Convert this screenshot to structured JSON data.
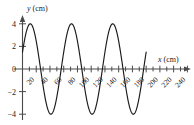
{
  "chart_data": {
    "type": "line",
    "title": "",
    "subtitle": "",
    "xlabel": "x (cm)",
    "ylabel": "y (cm)",
    "xlabel_symbol": "x",
    "xlabel_unit": "(cm)",
    "ylabel_symbol": "y",
    "ylabel_unit": "(cm)",
    "xlim": [
      0,
      250
    ],
    "ylim": [
      -4.6,
      4.6
    ],
    "grid": false,
    "legend": null,
    "x_major_ticks": [
      20,
      40,
      60,
      80,
      100,
      120,
      140,
      160,
      180,
      200,
      220,
      240
    ],
    "x_tick_labels": [
      "20",
      "40",
      "60",
      "80",
      "100",
      "120",
      "140",
      "160",
      "180",
      "200",
      "220",
      "240"
    ],
    "x_tick_label_rotation": -45,
    "x_all_ticks": [
      10,
      20,
      30,
      40,
      50,
      60,
      70,
      80,
      90,
      100,
      110,
      120,
      130,
      140,
      150,
      160,
      170,
      180,
      190,
      200,
      210,
      220,
      230,
      240
    ],
    "x_tick_step": 10,
    "y_ticks": [
      -4,
      -2,
      0,
      2,
      4
    ],
    "y_tick_labels": [
      "−4",
      "−2",
      "0",
      "2",
      "4"
    ],
    "series": [
      {
        "name": "wave",
        "description": "sinusoidal wave",
        "amplitude_cm": 4,
        "wavelength_cm": 60,
        "phase_deg": 22,
        "x_start_cm": 0,
        "x_end_cm": 180,
        "cycles": 3,
        "y_at_x0_cm": 1.5,
        "color": "#1a1a1a",
        "peaks_x_cm": [
          11,
          71,
          131
        ],
        "troughs_x_cm": [
          41,
          101,
          161
        ],
        "zero_crossings_cm": [
          26,
          56,
          86,
          116,
          146,
          176
        ]
      }
    ],
    "axis_color": "#4a4a4a",
    "curve_color": "#1a1a1a",
    "background": "#ffffff"
  },
  "figure": {
    "x_axis_name": "x-axis",
    "y_axis_name": "y-axis",
    "arrow_x_name": "x-axis-arrow",
    "arrow_y_name": "y-axis-arrow"
  }
}
